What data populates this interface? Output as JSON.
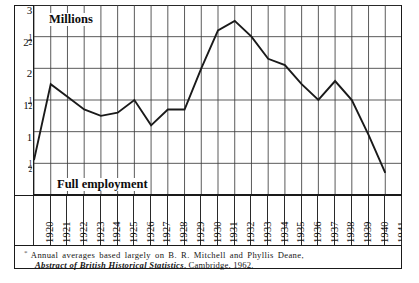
{
  "figure": {
    "axis_title": "Millions",
    "baseline_label": "Full employment",
    "footnote_marker": "*",
    "footnote_line1": "Annual averages based largely on B. R. Mitchell and Phyllis Deane,",
    "footnote_line2_italic": "Abstract of British Historical Statistics",
    "footnote_line2_rest": ", Cambridge, 1962.",
    "line_color": "#1a1a1a",
    "grid_color": "#3d3d3d",
    "frame_color": "#1a1a1a",
    "background": "#ffffff"
  },
  "chart_data": {
    "type": "line",
    "title": "Millions",
    "xlabel": "",
    "ylabel": "Millions",
    "ylim": [
      0.0,
      3.0
    ],
    "xlim": [
      1920,
      1941
    ],
    "grid": true,
    "legend": "none",
    "ytick_values": [
      0.5,
      1.0,
      1.5,
      2.0,
      2.5,
      3.0
    ],
    "ytick_labels": [
      "1/2",
      "1",
      "1 1/2",
      "2",
      "2 1/2",
      "3"
    ],
    "x": [
      1920,
      1921,
      1922,
      1923,
      1924,
      1925,
      1926,
      1927,
      1928,
      1929,
      1930,
      1931,
      1932,
      1933,
      1934,
      1935,
      1936,
      1937,
      1938,
      1939,
      1940,
      1941
    ],
    "xtick_labels": [
      "1920",
      "1921",
      "1922",
      "1923",
      "1924",
      "1925",
      "1926",
      "1927",
      "1928",
      "1929",
      "1930",
      "1931",
      "1932",
      "1933",
      "1934",
      "1935",
      "1936",
      "1937",
      "1938",
      "1939",
      "1940",
      "1941"
    ],
    "values": [
      0.55,
      1.75,
      1.55,
      1.35,
      1.25,
      1.3,
      1.5,
      1.1,
      1.35,
      1.35,
      2.0,
      2.6,
      2.75,
      2.5,
      2.15,
      2.05,
      1.75,
      1.5,
      1.8,
      1.5,
      0.95,
      0.35
    ],
    "annotations": [
      {
        "text": "Millions",
        "x": 1921.3,
        "y": 2.85
      },
      {
        "text": "Full employment",
        "x": 1921.6,
        "y": 0.4
      }
    ]
  }
}
